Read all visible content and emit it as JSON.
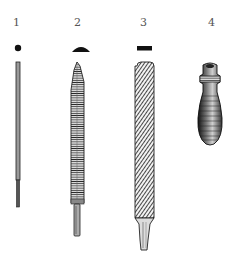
{
  "figure": {
    "labels": [
      "1",
      "2",
      "3",
      "4"
    ],
    "items": [
      {
        "number": "1",
        "name": "round-file",
        "cross_section": "circle"
      },
      {
        "number": "2",
        "name": "half-round-file",
        "cross_section": "half-round"
      },
      {
        "number": "3",
        "name": "flat-file",
        "cross_section": "rectangle"
      },
      {
        "number": "4",
        "name": "file-handle",
        "cross_section": "none"
      }
    ],
    "colors": {
      "ink": "#1a1a1a",
      "label": "#555555",
      "background": "#ffffff"
    }
  }
}
